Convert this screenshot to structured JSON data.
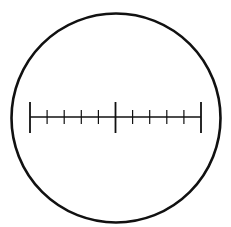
{
  "diagram": {
    "colors": {
      "stroke": "#111111",
      "background": "#ffffff"
    },
    "circle": {
      "cx": 116,
      "cy": 118,
      "r": 104.5,
      "stroke_width": 2.6
    },
    "scale": {
      "y": 117,
      "x_start": 30,
      "x_end": 201,
      "divisions": 10,
      "line_width": 1.6,
      "major_ticks": {
        "positions": [
          30,
          115.5,
          201
        ],
        "y_top": 102,
        "y_bottom": 133,
        "width": 1.8
      },
      "minor_ticks": {
        "positions": [
          47.1,
          64.2,
          81.3,
          98.4,
          132.6,
          149.7,
          166.8,
          183.9
        ],
        "y_top": 110,
        "y_bottom": 124,
        "width": 1.2
      }
    }
  }
}
